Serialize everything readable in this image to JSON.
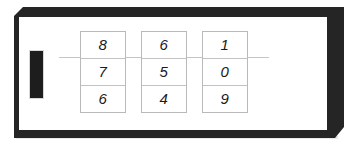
{
  "figure": {
    "black_bar_label": "black-bar",
    "frame_label": "3d-panel"
  },
  "counters": [
    {
      "name": "counter-column-1",
      "digits": [
        "8",
        "7",
        "6"
      ]
    },
    {
      "name": "counter-column-2",
      "digits": [
        "6",
        "5",
        "4"
      ]
    },
    {
      "name": "counter-column-3",
      "digits": [
        "1",
        "0",
        "9"
      ]
    }
  ],
  "colors": {
    "frame_dark": "#252525",
    "panel_face": "#ffffff",
    "bar_black": "#1d1d1d",
    "cell_border": "#b9b9b9",
    "connector_line": "#c4c4c4",
    "digit_color": "#1a1a1a"
  }
}
